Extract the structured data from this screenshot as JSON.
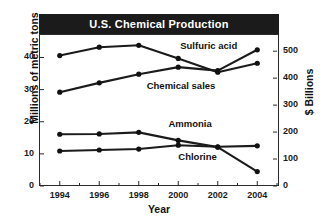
{
  "chart_data": {
    "type": "line",
    "title": "U.S. Chemical Production",
    "xlabel": "Year",
    "ylabel": "Millions of metric tons",
    "ylabel_right": "$ Billions",
    "x": [
      1994,
      1996,
      1998,
      2000,
      2002,
      2004
    ],
    "xtick_labels": [
      "1994",
      "1996",
      "1998",
      "2000",
      "2002",
      "2004"
    ],
    "xlim": [
      1993,
      2005
    ],
    "ylim": [
      0,
      47
    ],
    "yticks": [
      0,
      10,
      20,
      30,
      40
    ],
    "ytick_labels": [
      "0",
      "10",
      "20",
      "30",
      "40"
    ],
    "ylim_right": [
      0,
      560
    ],
    "yticks_right": [
      0,
      100,
      200,
      300,
      400,
      500
    ],
    "ytick_labels_right": [
      "0",
      "100",
      "200",
      "300",
      "400",
      "500"
    ],
    "grid": false,
    "legend": "inline-annotations",
    "series": [
      {
        "name": "Sulfuric acid",
        "axis": "left",
        "units": "millions of metric tons",
        "values": [
          40.6,
          43.2,
          43.8,
          39.7,
          35.4,
          38.2
        ],
        "label_x": 2000.1,
        "label_y": 43.6
      },
      {
        "name": "Chemical sales",
        "axis": "right",
        "units": "$ billions",
        "values": [
          348,
          382,
          415,
          441,
          428,
          505
        ],
        "values_left_scale": [
          29.2,
          32.1,
          34.8,
          37.0,
          35.9,
          42.4
        ],
        "label_x": 1998.4,
        "label_y": 31.0
      },
      {
        "name": "Ammonia",
        "axis": "left",
        "units": "millions of metric tons",
        "values": [
          16.1,
          16.2,
          16.7,
          14.2,
          12.1,
          4.5
        ],
        "label_x": 1999.5,
        "label_y": 19.4
      },
      {
        "name": "Chlorine",
        "axis": "left",
        "units": "millions of metric tons",
        "values": [
          10.9,
          11.2,
          11.5,
          12.7,
          12.2,
          12.5
        ],
        "label_x": 2000.0,
        "label_y": 8.9
      }
    ],
    "colors": {
      "line": "#1b1b1b",
      "marker": "#111111",
      "banner_background": "#1b1b1b",
      "banner_text": "#ffffff",
      "axis": "#2b2b2b",
      "plot_background": "#ffffff"
    }
  }
}
